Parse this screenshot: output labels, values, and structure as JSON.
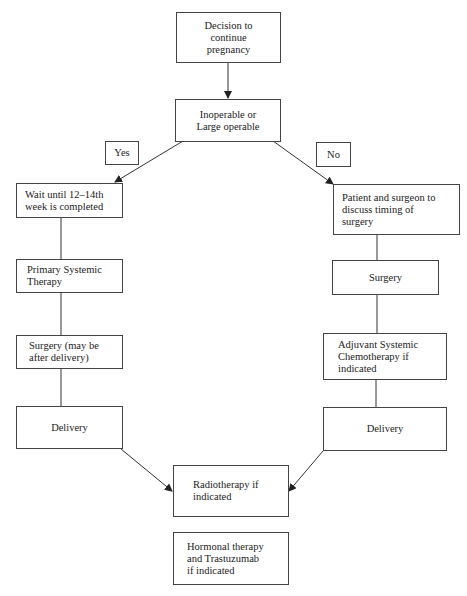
{
  "diagram": {
    "type": "flowchart",
    "nodes": {
      "decision": "Decision to\ncontinue\npregnancy",
      "inoperable": "Inoperable or\nLarge operable",
      "yes_label": "Yes",
      "no_label": "No",
      "wait": "Wait until 12–14th\nweek is completed",
      "patient_surgeon": "Patient and surgeon to\ndiscuss timing of\nsurgery",
      "primary_systemic": "Primary Systemic\nTherapy",
      "surgery_right": "Surgery",
      "surgery_left": "Surgery (may be\nafter delivery)",
      "adjuvant": "Adjuvant  Systemic\nChemotherapy if\nindicated",
      "delivery_left": "Delivery",
      "delivery_right": "Delivery",
      "radiotherapy": "Radiotherapy if\nindicated",
      "hormonal": "Hormonal therapy\nand Trastuzumab\nif indicated"
    },
    "edges": [
      {
        "from": "decision",
        "to": "inoperable",
        "arrow": true
      },
      {
        "from": "inoperable",
        "to": "wait",
        "label": "Yes",
        "arrow": true
      },
      {
        "from": "inoperable",
        "to": "patient_surgeon",
        "label": "No",
        "arrow": true
      },
      {
        "from": "wait",
        "to": "primary_systemic",
        "arrow": false
      },
      {
        "from": "primary_systemic",
        "to": "surgery_left",
        "arrow": false
      },
      {
        "from": "surgery_left",
        "to": "delivery_left",
        "arrow": false
      },
      {
        "from": "patient_surgeon",
        "to": "surgery_right",
        "arrow": false
      },
      {
        "from": "surgery_right",
        "to": "adjuvant",
        "arrow": false
      },
      {
        "from": "adjuvant",
        "to": "delivery_right",
        "arrow": false
      },
      {
        "from": "delivery_left",
        "to": "radiotherapy",
        "arrow": true
      },
      {
        "from": "delivery_right",
        "to": "radiotherapy",
        "arrow": true
      }
    ]
  }
}
